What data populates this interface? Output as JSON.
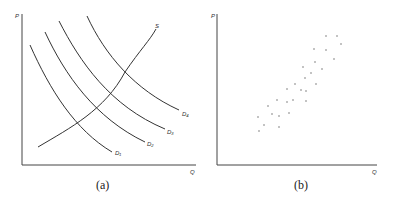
{
  "panels": [
    {
      "caption": "(a)",
      "y_axis_label": "P",
      "x_axis_label": "Q",
      "curves": [
        {
          "label": "S",
          "type": "supply"
        },
        {
          "label": "D₁",
          "type": "demand"
        },
        {
          "label": "D₂",
          "type": "demand"
        },
        {
          "label": "D₃",
          "type": "demand"
        },
        {
          "label": "D₄",
          "type": "demand"
        }
      ]
    },
    {
      "caption": "(b)",
      "y_axis_label": "P",
      "x_axis_label": "Q",
      "points_description": "scatter of price-quantity observations trending upward"
    }
  ],
  "colors": {
    "line": "#333333",
    "point": "#777777"
  }
}
